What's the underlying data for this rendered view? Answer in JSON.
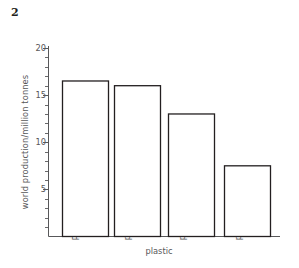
{
  "question_number": "2",
  "chart_data": {
    "type": "bar",
    "title": "",
    "categories": [
      "PVC",
      "polythene",
      "poly(propene)",
      "polystyrene"
    ],
    "values": [
      16.5,
      16.0,
      13.0,
      7.5
    ],
    "xlabel": "plastic",
    "ylabel": "world production/million tonnes",
    "ylim": [
      0,
      20
    ],
    "ytick_labels": [
      "20",
      "15",
      "10",
      "5"
    ],
    "ytick_values": [
      20,
      15,
      10,
      5
    ],
    "minor_tick_step": 1,
    "grid": false,
    "legend": null,
    "bar_fill": "#ffffff",
    "bar_edge": "#231f20",
    "axis_color": "#58585a"
  }
}
